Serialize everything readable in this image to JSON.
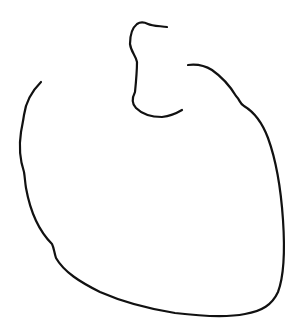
{
  "drawing": {
    "subject": "heart-outline-sketch",
    "background": "#ffffff",
    "stroke_color": "#111111",
    "stroke_width": 2.2,
    "strokes": [
      {
        "name": "heart-body-outline",
        "d": "M41,82 C33,90 26,100 24,115 C23,122 22,126 21,132 C19,145 20,160 24,172 C25,178 25,182 26,188 C30,210 38,230 52,244 C54,248 54,252 56,258 C64,272 80,282 100,292 C125,303 150,309 175,313 C200,316 225,318 245,314 C262,311 272,305 278,292 C284,276 285,250 283,220 C281,190 276,160 268,138 C262,122 254,112 244,106 C240,104 240,100 236,96 C230,86 222,77 212,70 C204,65 196,64 188,65"
      },
      {
        "name": "heart-vessel-neck",
        "d": "M167,27 C160,26 152,26 148,24 C144,22 140,22 137,24 C132,28 130,36 130,44 C131,52 136,56 137,62 C137,72 136,82 135,92 C132,98 132,104 136,108 C142,114 152,117 162,117 C170,116 177,113 182,110"
      }
    ]
  }
}
